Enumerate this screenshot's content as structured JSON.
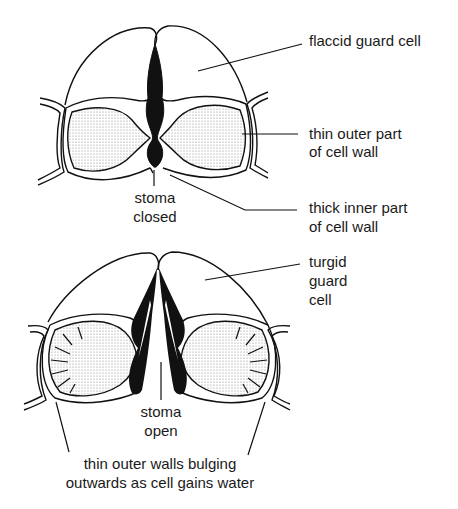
{
  "diagram": {
    "colors": {
      "ink": "#111111",
      "background": "#ffffff",
      "stipple": "#9a9a9a"
    },
    "top_figure": {
      "state": "closed",
      "labels": {
        "flaccid": "flaccid guard cell",
        "thin_outer_1": "thin outer part",
        "thin_outer_2": "of cell wall",
        "thick_inner_1": "thick inner part",
        "thick_inner_2": "of cell wall",
        "stoma_1": "stoma",
        "stoma_2": "closed"
      }
    },
    "bottom_figure": {
      "state": "open",
      "labels": {
        "turgid_1": "turgid",
        "turgid_2": "guard",
        "turgid_3": "cell",
        "stoma_1": "stoma",
        "stoma_2": "open",
        "caption_1": "thin outer walls bulging",
        "caption_2": "outwards as cell gains water"
      }
    }
  }
}
